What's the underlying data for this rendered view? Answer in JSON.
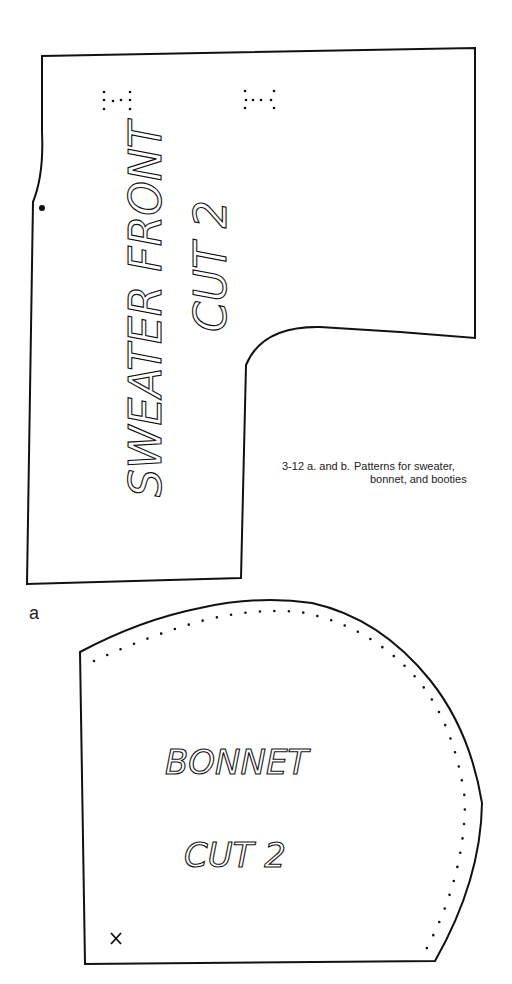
{
  "figure": {
    "caption_number": "3-12  a. and b.",
    "caption_line1": "Patterns for sweater,",
    "caption_line2": "bonnet, and booties",
    "panel_label": "a"
  },
  "patterns": [
    {
      "name": "sweater-front",
      "title": "SWEATER FRONT",
      "instruction": "CUT 2",
      "orientation": "vertical (rotated -90°)",
      "markings": [
        "buttonhole-marks x2",
        "notch-dot"
      ]
    },
    {
      "name": "bonnet",
      "title": "BONNET",
      "instruction": "CUT 2",
      "orientation": "horizontal",
      "markings": [
        "dotted-seam-line",
        "x-mark"
      ]
    }
  ],
  "colors": {
    "ink": "#111111",
    "paper": "#ffffff"
  }
}
